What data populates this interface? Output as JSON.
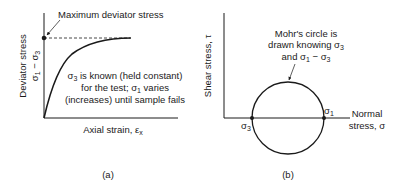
{
  "panel_a": {
    "caption": "(a)",
    "y_axis_label_line1": "Deviator stress",
    "y_axis_label_line2": "σ",
    "y_axis_label_sub1": "1",
    "y_axis_label_mid": " − σ",
    "y_axis_label_sub3": "3",
    "x_axis_label": "Axial strain, ε",
    "x_axis_label_sub": "x",
    "max_annotation": "Maximum deviator stress",
    "note_line1_pre": "σ",
    "note_line1_sub": "3",
    "note_line1_post": " is known (held constant)",
    "note_line2_pre": "for the test; σ",
    "note_line2_sub": "1",
    "note_line2_post": " varies",
    "note_line3": "(increases) until sample fails"
  },
  "panel_b": {
    "caption": "(b)",
    "y_axis_label": "Shear stress, τ",
    "x_axis_label_line1": "Normal",
    "x_axis_label_line2": "stress, σ",
    "note_line1": "Mohr's circle is",
    "note_line2_pre": "drawn knowing σ",
    "note_line2_sub": "3",
    "note_line3_pre": "and σ",
    "note_line3_sub1": "1",
    "note_line3_mid": " − σ",
    "note_line3_sub3": "3",
    "point_left": "σ",
    "point_left_sub": "3",
    "point_right": "σ",
    "point_right_sub": "1"
  },
  "colors": {
    "ink": "#1a1a1a",
    "background": "#ffffff"
  }
}
